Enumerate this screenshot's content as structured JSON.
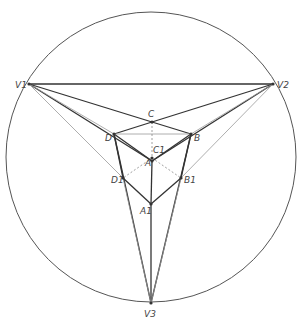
{
  "circle": {
    "cx": 151,
    "cy": 157,
    "r": 145
  },
  "points": {
    "V1": {
      "x": 29,
      "y": 84,
      "label": "V1",
      "lx": 15,
      "ly": 88
    },
    "V2": {
      "x": 273,
      "y": 84,
      "label": "V2",
      "lx": 277,
      "ly": 88
    },
    "V3": {
      "x": 151,
      "y": 303,
      "label": "V3",
      "lx": 144,
      "ly": 317
    },
    "C": {
      "x": 152,
      "y": 122,
      "label": "C",
      "lx": 148,
      "ly": 117
    },
    "D": {
      "x": 114,
      "y": 134,
      "label": "D",
      "lx": 105,
      "ly": 141
    },
    "B": {
      "x": 191,
      "y": 134,
      "label": "B",
      "lx": 194,
      "ly": 141
    },
    "C1": {
      "x": 152,
      "y": 158,
      "label": "C1",
      "lx": 153,
      "ly": 153
    },
    "A": {
      "x": 152,
      "y": 161,
      "label": "A",
      "lx": 145,
      "ly": 166
    },
    "D1": {
      "x": 123,
      "y": 178,
      "label": "D1",
      "lx": 111,
      "ly": 183
    },
    "B1": {
      "x": 181,
      "y": 178,
      "label": "B1",
      "lx": 184,
      "ly": 183
    },
    "A1": {
      "x": 151,
      "y": 204,
      "label": "A1",
      "lx": 140,
      "ly": 214
    }
  },
  "labels": [
    "V1",
    "V2",
    "V3",
    "C",
    "D",
    "B",
    "C1",
    "A",
    "D1",
    "B1",
    "A1"
  ]
}
